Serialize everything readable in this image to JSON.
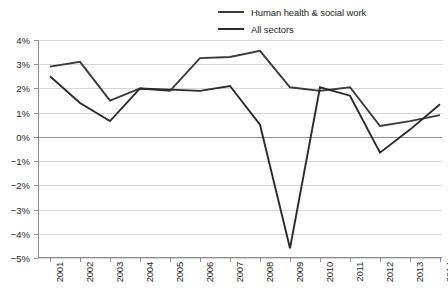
{
  "legend": {
    "position": "top-right",
    "items": [
      {
        "label": "Human health & social work",
        "color": "#3a3a3a",
        "width": 1.9,
        "swatch_name": "legend-swatch-health"
      },
      {
        "label": "All sectors",
        "color": "#2b2b2b",
        "width": 1.9,
        "swatch_name": "legend-swatch-all-sectors"
      }
    ]
  },
  "axes": {
    "y_ticks": [
      "4%",
      "3%",
      "2%",
      "1%",
      "0%",
      "−1%",
      "−2%",
      "−3%",
      "−4%",
      "−5%"
    ],
    "x_ticks": [
      "2001",
      "2002",
      "2003",
      "2004",
      "2005",
      "2006",
      "2007",
      "2008",
      "2009",
      "2010",
      "2011",
      "2012",
      "2013",
      "2014"
    ]
  },
  "chart_data": {
    "type": "line",
    "title": "",
    "subtitle": "",
    "xlabel": "",
    "ylabel": "",
    "ylim": [
      -5,
      4
    ],
    "ytick_values": [
      4,
      3,
      2,
      1,
      0,
      -1,
      -2,
      -3,
      -4,
      -5
    ],
    "grid": true,
    "legend_position": "top-right",
    "units": "percent",
    "categories": [
      "2001",
      "2002",
      "2003",
      "2004",
      "2005",
      "2006",
      "2007",
      "2008",
      "2009",
      "2010",
      "2011",
      "2012",
      "2013",
      "2014"
    ],
    "series": [
      {
        "name": "Human health & social work",
        "color": "#3a3a3a",
        "values": [
          2.9,
          3.1,
          1.5,
          2.0,
          1.9,
          3.25,
          3.3,
          3.55,
          2.05,
          1.9,
          2.05,
          0.45,
          0.65,
          0.9
        ]
      },
      {
        "name": "All sectors",
        "color": "#2b2b2b",
        "values": [
          2.5,
          1.4,
          0.65,
          2.0,
          1.95,
          1.9,
          2.1,
          0.5,
          -4.6,
          2.05,
          1.7,
          -0.65,
          0.3,
          1.35
        ]
      }
    ],
    "annotations": []
  },
  "colors": {
    "gridline": "#d6d6d6",
    "axis": "#8e8e8e",
    "zero_line": "#8e8e8e",
    "text": "#231f20",
    "background": "#ffffff"
  }
}
